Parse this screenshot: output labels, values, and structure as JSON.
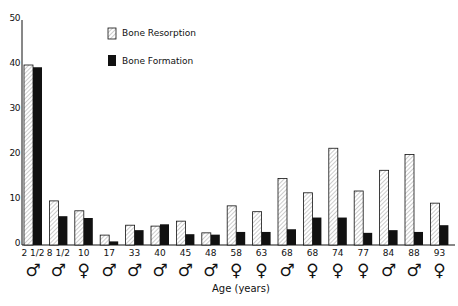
{
  "chart_data": {
    "type": "bar",
    "title": "",
    "xlabel": "Age (years)",
    "ylabel": "",
    "ylim": [
      0,
      50
    ],
    "yticks": [
      0,
      10,
      20,
      30,
      40,
      50
    ],
    "grid": false,
    "legend_position": "upper-left-inside",
    "categories": [
      "2 1/2",
      "8 1/2",
      "10",
      "17",
      "33",
      "40",
      "45",
      "48",
      "58",
      "63",
      "68",
      "68",
      "74",
      "77",
      "84",
      "88",
      "93"
    ],
    "sex": [
      "♂",
      "♂",
      "♀",
      "♂",
      "♂",
      "♂",
      "♂",
      "♂",
      "♀",
      "♀",
      "♂",
      "♀",
      "♀",
      "♀",
      "♂",
      "♂",
      "♀"
    ],
    "series": [
      {
        "name": "Bone Resorption",
        "pattern": "hatched",
        "values": [
          40,
          9.8,
          7.6,
          2.2,
          4.4,
          4.2,
          5.3,
          2.7,
          8.7,
          7.4,
          14.8,
          11.6,
          21.5,
          12,
          16.6,
          20.1,
          9.3
        ]
      },
      {
        "name": "Bone Formation",
        "pattern": "solid-black",
        "values": [
          39.5,
          6.4,
          6,
          0.8,
          3.3,
          4.6,
          2.4,
          2.3,
          2.9,
          2.9,
          3.5,
          6.1,
          6.1,
          2.7,
          3.3,
          2.9,
          4.4
        ]
      }
    ]
  },
  "legend": {
    "resorption_label": "Bone Resorption",
    "formation_label": "Bone Formation"
  },
  "axis": {
    "x_title": "Age (years)"
  },
  "colors": {
    "ink": "#111111",
    "background": "#ffffff"
  }
}
